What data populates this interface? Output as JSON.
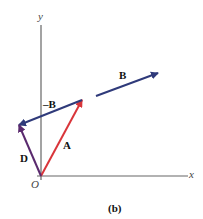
{
  "diagram": {
    "caption": "(b)",
    "axes": {
      "x_label": "x",
      "y_label": "y",
      "origin_label": "O"
    },
    "vectors": [
      {
        "name": "A",
        "label": "A",
        "color": "#d9353a",
        "from": [
          41,
          176
        ],
        "to": [
          82,
          100
        ]
      },
      {
        "name": "B",
        "label": "B",
        "color": "#2f3a7a",
        "from": [
          96,
          96
        ],
        "to": [
          158,
          73
        ]
      },
      {
        "name": "-B",
        "label": "–B",
        "color": "#2f3a7a",
        "from": [
          82,
          100
        ],
        "to": [
          19,
          125
        ]
      },
      {
        "name": "D",
        "label": "D",
        "color": "#5a2a6e",
        "from": [
          41,
          176
        ],
        "to": [
          19,
          125
        ]
      }
    ]
  }
}
